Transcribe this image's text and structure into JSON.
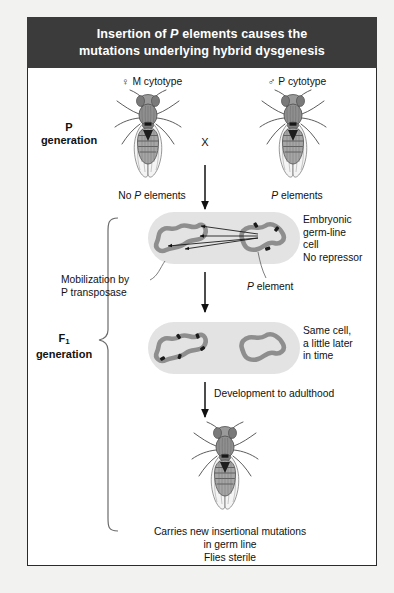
{
  "figure": {
    "title_line1_pre": "Insertion of ",
    "title_line1_italic": "P",
    "title_line1_post": " elements causes the",
    "title_line2": "mutations underlying hybrid dysgenesis",
    "title_full": "Insertion of P elements causes the mutations underlying hybrid dysgenesis"
  },
  "colors": {
    "title_bar": "#3b3b3b",
    "title_text": "#ffffff",
    "page_background": "#f2f2f0",
    "panel_background": "#ffffff",
    "frame_border": "#2b2b2b",
    "cell_fill": "#e2e2e2",
    "chromosome": "#8c8c8c",
    "p_element_mark": "#1a1a1a",
    "arrow": "#111111"
  },
  "parents": {
    "female_label_symbol": "♀",
    "female_label_text": "M cytotype",
    "male_label_symbol": "♂",
    "male_label_text": "P cytotype",
    "generation_label_line1": "P",
    "generation_label_line2": "generation",
    "cross_symbol": "X",
    "female_elements_pre": "No ",
    "female_elements_italic": "P",
    "female_elements_post": " elements",
    "male_elements_italic": "P",
    "male_elements_post": " elements"
  },
  "f1": {
    "generation_label_line1": "F",
    "generation_label_subscript": "1",
    "generation_label_line2": "generation"
  },
  "cell1": {
    "note_line1": "Embryonic",
    "note_line2": "germ-line",
    "note_line3": "cell",
    "note_line4": "No repressor",
    "mobilization_line1": "Mobilization by",
    "mobilization_line2": "P transposase",
    "p_element_italic": "P",
    "p_element_post": " element"
  },
  "cell2": {
    "note_line1": "Same cell,",
    "note_line2": "a little later",
    "note_line3": "in time"
  },
  "development": {
    "arrow_label": "Development to adulthood"
  },
  "outcome": {
    "line1": "Carries new insertional mutations",
    "line2": "in germ line",
    "line3": "Flies sterile"
  }
}
